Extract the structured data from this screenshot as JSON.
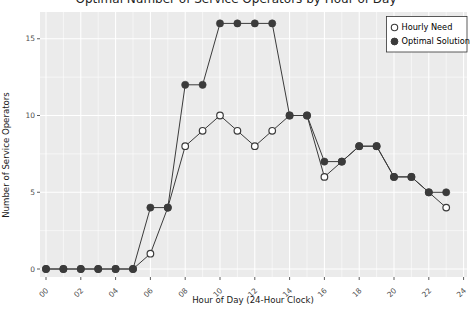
{
  "figure": {
    "title_partial": "Optimal Number of Service Operators by Hour of Day",
    "x_axis_label": "Hour of Day (24-Hour Clock)",
    "y_axis_label": "Number of Service Operators",
    "legend": {
      "position": "top-right-inside",
      "items": [
        {
          "label": "Hourly Need",
          "marker": "open-circle"
        },
        {
          "label": "Optimal Solution",
          "marker": "filled-circle"
        }
      ]
    }
  },
  "chart_data": {
    "type": "line",
    "title": "Optimal Number of Service Operators by Hour of Day",
    "xlabel": "Hour of Day (24-Hour Clock)",
    "ylabel": "Number of Service Operators",
    "x": [
      0,
      1,
      2,
      3,
      4,
      5,
      6,
      7,
      8,
      9,
      10,
      11,
      12,
      13,
      14,
      15,
      16,
      17,
      18,
      19,
      20,
      21,
      22,
      23
    ],
    "series": [
      {
        "name": "Hourly Need",
        "marker": "open",
        "values": [
          0,
          0,
          0,
          0,
          0,
          0,
          1,
          4,
          8,
          9,
          10,
          9,
          8,
          9,
          10,
          10,
          6,
          7,
          8,
          8,
          6,
          6,
          5,
          4
        ]
      },
      {
        "name": "Optimal Solution",
        "marker": "filled",
        "values": [
          0,
          0,
          0,
          0,
          0,
          0,
          4,
          4,
          12,
          12,
          16,
          16,
          16,
          16,
          10,
          10,
          7,
          7,
          8,
          8,
          6,
          6,
          5,
          5
        ]
      }
    ],
    "x_tick_values": [
      0,
      2,
      4,
      6,
      8,
      10,
      12,
      14,
      16,
      18,
      20,
      22,
      24
    ],
    "x_tick_labels": [
      "00",
      "02",
      "04",
      "06",
      "08",
      "10",
      "12",
      "14",
      "16",
      "18",
      "20",
      "22",
      "24"
    ],
    "y_tick_values": [
      0,
      5,
      10,
      15
    ],
    "y_tick_labels": [
      "0",
      "5",
      "10",
      "15"
    ],
    "x_minor_ticks": [
      1,
      3,
      5,
      7,
      9,
      11,
      13,
      15,
      17,
      19,
      21,
      23
    ],
    "y_minor_ticks": [
      2.5,
      7.5,
      12.5
    ],
    "xlim": [
      -0.35,
      24.2
    ],
    "ylim": [
      -0.5,
      16.75
    ],
    "grid": {
      "major": true,
      "minor": true
    },
    "legend_position": "top-right-inside",
    "colors": {
      "panel_bg": "#EBEBEB",
      "grid": "#FFFFFF",
      "series": "#3B3B3B",
      "open_marker_fill": "#FFFFFF",
      "axis_text": "#4D4D4D",
      "axis_title": "#1A1A1A",
      "legend_bg": "#FFFFFF",
      "legend_border": "#333333"
    }
  }
}
